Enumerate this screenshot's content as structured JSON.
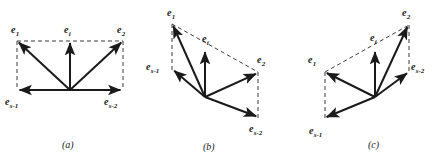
{
  "figure": {
    "background_color": "#ffffff",
    "stroke_color": "#1a1a1a",
    "dashed_color": "#3a3a3a",
    "panels": [
      {
        "id": "a",
        "caption": "(a)",
        "caption_pos": {
          "x": 62,
          "y": 140
        },
        "geometry": {
          "origin": {
            "x": 70,
            "y": 90
          },
          "e1": {
            "x": 17,
            "y": 41
          },
          "e2": {
            "x": 123,
            "y": 41
          },
          "ei": {
            "x": 70,
            "y": 41
          },
          "es1": {
            "x": 17,
            "y": 90
          },
          "es2": {
            "x": 123,
            "y": 90
          }
        },
        "labels": [
          {
            "name": "e1",
            "base": "e",
            "sub": "1",
            "x": 11,
            "y": 25
          },
          {
            "name": "ei",
            "base": "e",
            "sub": "i",
            "x": 64,
            "y": 25
          },
          {
            "name": "e2",
            "base": "e",
            "sub": "2",
            "x": 117,
            "y": 25
          },
          {
            "name": "es1",
            "base": "e",
            "sub": "s-1",
            "x": 5,
            "y": 97
          },
          {
            "name": "es2",
            "base": "e",
            "sub": "s-2",
            "x": 104,
            "y": 97
          }
        ]
      },
      {
        "id": "b",
        "caption": "(b)",
        "caption_pos": {
          "x": 203,
          "y": 142
        },
        "geometry": {
          "origin": {
            "x": 60,
            "y": 97
          },
          "e1": {
            "x": 27,
            "y": 24
          },
          "e2": {
            "x": 113,
            "y": 72
          },
          "ei": {
            "x": 60,
            "y": 50
          },
          "es1": {
            "x": 27,
            "y": 70
          },
          "es2": {
            "x": 113,
            "y": 118
          }
        },
        "labels": [
          {
            "name": "e1",
            "base": "e",
            "sub": "1",
            "x": 22,
            "y": 8
          },
          {
            "name": "ei",
            "base": "e",
            "sub": "i",
            "x": 57,
            "y": 34
          },
          {
            "name": "e2",
            "base": "e",
            "sub": "2",
            "x": 112,
            "y": 55
          },
          {
            "name": "es1",
            "base": "e",
            "sub": "s-1",
            "x": 1,
            "y": 62
          },
          {
            "name": "es2",
            "base": "e",
            "sub": "s-2",
            "x": 104,
            "y": 124
          }
        ]
      },
      {
        "id": "c",
        "caption": "(c)",
        "caption_pos": {
          "x": 78,
          "y": 140
        },
        "geometry": {
          "origin": {
            "x": 85,
            "y": 97
          },
          "e1": {
            "x": 35,
            "y": 72
          },
          "e2": {
            "x": 119,
            "y": 25
          },
          "ei": {
            "x": 85,
            "y": 50
          },
          "es1": {
            "x": 35,
            "y": 119
          },
          "es2": {
            "x": 119,
            "y": 72
          }
        },
        "labels": [
          {
            "name": "e1",
            "base": "e",
            "sub": "1",
            "x": 18,
            "y": 55
          },
          {
            "name": "ei",
            "base": "e",
            "sub": "i",
            "x": 80,
            "y": 33
          },
          {
            "name": "e2",
            "base": "e",
            "sub": "2",
            "x": 112,
            "y": 8
          },
          {
            "name": "es1",
            "base": "e",
            "sub": "s-1",
            "x": 19,
            "y": 126
          },
          {
            "name": "es2",
            "base": "e",
            "sub": "s-2",
            "x": 121,
            "y": 62
          }
        ]
      }
    ]
  }
}
